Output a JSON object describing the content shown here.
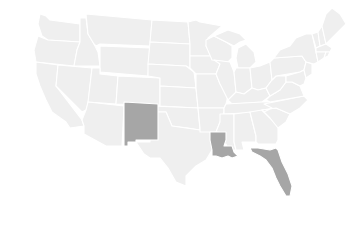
{
  "map": {
    "type": "choropleth",
    "region": "United States",
    "colors": {
      "default_fill": "#efefef",
      "highlight_fill": "#a6a6a6",
      "border": "#ffffff",
      "background": "#ffffff"
    },
    "highlighted_states": [
      "New Mexico",
      "Louisiana",
      "Florida"
    ]
  }
}
